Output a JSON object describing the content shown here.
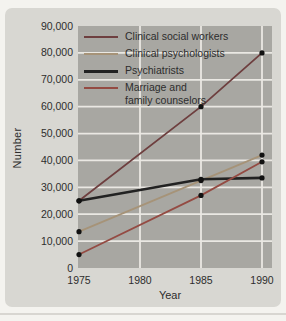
{
  "colors": {
    "page_bg": "#f4f3ef",
    "card_bg": "#d8d7d2",
    "plot_bg": "#a8a7a2",
    "grid": "#eae8e3",
    "text": "#2d2d2d",
    "marker": "#111111"
  },
  "chart_data": {
    "type": "line",
    "title": "",
    "xlabel": "Year",
    "ylabel": "Number",
    "xlim": [
      1975,
      1990
    ],
    "ylim": [
      0,
      90000
    ],
    "grid": true,
    "legend_position": "top-left",
    "x": [
      1975,
      1985,
      1990
    ],
    "xticks": {
      "values": [
        1975,
        1980,
        1985,
        1990
      ],
      "labels": [
        "1975",
        "1980",
        "1985",
        "1990"
      ]
    },
    "yticks": {
      "values": [
        0,
        10000,
        20000,
        30000,
        40000,
        50000,
        60000,
        70000,
        80000,
        90000
      ],
      "labels": [
        "0",
        "10,000",
        "20,000",
        "30,000",
        "40,000",
        "50,000",
        "60,000",
        "70,000",
        "80,000",
        "90,000"
      ]
    },
    "series": [
      {
        "id": "clinical-social-workers",
        "name": "Clinical social workers",
        "label_lines": [
          "Clinical social workers"
        ],
        "color": "#6e3f3f",
        "width": 1.8,
        "values": [
          25000,
          60000,
          80000
        ]
      },
      {
        "id": "clinical-psychologists",
        "name": "Clinical psychologists",
        "label_lines": [
          "Clinical psychologists"
        ],
        "color": "#a69378",
        "width": 1.8,
        "values": [
          13500,
          32500,
          42000
        ]
      },
      {
        "id": "psychiatrists",
        "name": "Psychiatrists",
        "label_lines": [
          "Psychiatrists"
        ],
        "color": "#222222",
        "width": 2.6,
        "values": [
          25000,
          33000,
          33500
        ]
      },
      {
        "id": "marriage-family-counselors",
        "name": "Marriage and family counselors",
        "label_lines": [
          "Marriage and",
          "family counselors"
        ],
        "color": "#944b43",
        "width": 1.8,
        "values": [
          5000,
          27000,
          39500
        ]
      }
    ]
  }
}
